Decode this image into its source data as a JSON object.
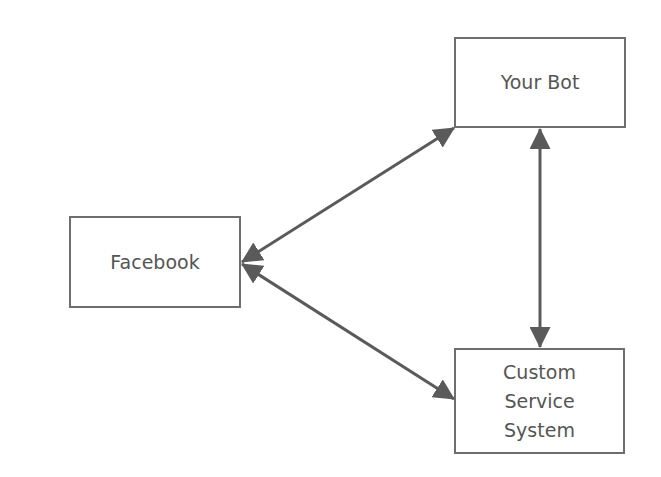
{
  "diagram": {
    "nodes": [
      {
        "id": "your-bot",
        "label": "Your Bot"
      },
      {
        "id": "facebook",
        "label": "Facebook"
      },
      {
        "id": "custom-service-system",
        "label_lines": [
          "Custom",
          "Service",
          "System"
        ]
      }
    ],
    "edges": [
      {
        "from": "facebook",
        "to": "your-bot",
        "direction": "bidirectional"
      },
      {
        "from": "facebook",
        "to": "custom-service-system",
        "direction": "bidirectional"
      },
      {
        "from": "your-bot",
        "to": "custom-service-system",
        "direction": "bidirectional"
      }
    ],
    "colors": {
      "stroke": "#5a5a5a",
      "text": "#555555",
      "background": "#ffffff"
    }
  }
}
